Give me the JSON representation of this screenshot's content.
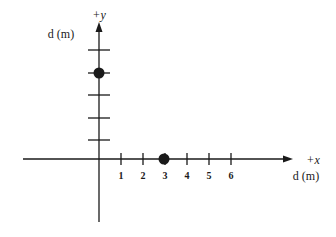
{
  "diagram": {
    "colors": {
      "ink": "#1a1a1a",
      "background": "#ffffff"
    },
    "y_axis": {
      "direction_label": "+y",
      "unit_label": "d (m)",
      "tick_count": 5
    },
    "x_axis": {
      "direction_label": "+x",
      "unit_label": "d (m)",
      "tick_labels": [
        "1",
        "2",
        "3",
        "4",
        "5",
        "6"
      ]
    },
    "points": [
      {
        "name": "point-on-x-axis",
        "x": 3,
        "y": 0
      },
      {
        "name": "point-on-y-axis",
        "x": 0,
        "y": 4
      }
    ]
  }
}
